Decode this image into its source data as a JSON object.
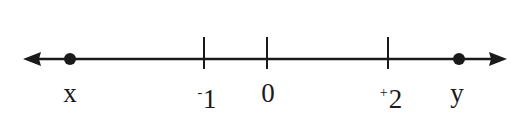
{
  "diagram": {
    "type": "number-line",
    "colors": {
      "line": "#1a1a1a",
      "background": "#ffffff"
    },
    "axis": {
      "arrows": [
        "left",
        "right"
      ]
    },
    "ticks": [
      {
        "value": -1,
        "sign": "-",
        "digit": "1",
        "x": 204
      },
      {
        "value": 0,
        "sign": "",
        "digit": "0",
        "x": 267
      },
      {
        "value": 2,
        "sign": "+",
        "digit": "2",
        "x": 388
      }
    ],
    "points": [
      {
        "label": "x",
        "x": 70
      },
      {
        "label": "y",
        "x": 459
      }
    ]
  }
}
